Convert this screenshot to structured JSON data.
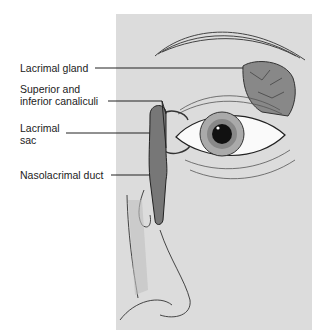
{
  "figure": {
    "panel_color": "#dcdcdc",
    "labels": [
      {
        "id": "lacrimal-gland",
        "lines": [
          "Lacrimal gland"
        ]
      },
      {
        "id": "canaliculi",
        "lines": [
          "Superior and",
          "inferior canaliculi"
        ]
      },
      {
        "id": "lacrimal-sac",
        "lines": [
          "Lacrimal",
          "sac"
        ]
      },
      {
        "id": "nasolacrimal-duct",
        "lines": [
          "Nasolacrimal duct"
        ]
      }
    ]
  }
}
